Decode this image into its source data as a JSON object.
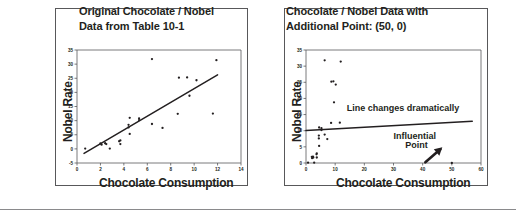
{
  "figure": {
    "background": "#ffffff",
    "ink": "#231f20",
    "frame_color": "#58585a",
    "bottom_rule": true
  },
  "panels": [
    {
      "id": "left",
      "title": "Original Chocolate / Nobel\nData from Table 10-1"
    },
    {
      "id": "right",
      "title": "Chocolate / Nobel Data with\nAdditional Point: (50, 0)"
    }
  ],
  "chart_data": [
    {
      "type": "scatter",
      "title": "Original Chocolate / Nobel Data from Table 10-1",
      "xlabel": "Chocolate Consumption",
      "ylabel": "Nobel Rate",
      "xlim": [
        0,
        14
      ],
      "ylim": [
        -5,
        35
      ],
      "xticks": [
        0,
        2,
        4,
        6,
        8,
        10,
        12,
        14
      ],
      "yticks": [
        -5,
        0,
        5,
        10,
        15,
        20,
        25,
        30,
        35
      ],
      "grid": false,
      "legend": null,
      "points": [
        {
          "x": 0.7,
          "y": 0.1
        },
        {
          "x": 2.0,
          "y": 1.9
        },
        {
          "x": 2.1,
          "y": 1.5
        },
        {
          "x": 2.4,
          "y": 2.0
        },
        {
          "x": 2.5,
          "y": 1.7
        },
        {
          "x": 2.8,
          "y": 0.1
        },
        {
          "x": 3.6,
          "y": 2.7
        },
        {
          "x": 3.7,
          "y": 1.7
        },
        {
          "x": 3.7,
          "y": 3.0
        },
        {
          "x": 4.4,
          "y": 8.5
        },
        {
          "x": 4.4,
          "y": 7.6
        },
        {
          "x": 4.5,
          "y": 11.0
        },
        {
          "x": 4.5,
          "y": 5.3
        },
        {
          "x": 5.3,
          "y": 10.2
        },
        {
          "x": 5.3,
          "y": 10.8
        },
        {
          "x": 6.4,
          "y": 31.8
        },
        {
          "x": 6.4,
          "y": 8.8
        },
        {
          "x": 7.3,
          "y": 7.4
        },
        {
          "x": 8.6,
          "y": 12.4
        },
        {
          "x": 8.7,
          "y": 25.2
        },
        {
          "x": 9.4,
          "y": 25.3
        },
        {
          "x": 9.6,
          "y": 18.8
        },
        {
          "x": 10.2,
          "y": 24.3
        },
        {
          "x": 11.6,
          "y": 12.5
        },
        {
          "x": 11.9,
          "y": 31.4
        }
      ],
      "fit_line": {
        "x1": 0.6,
        "y1": -1.6,
        "x2": 12.0,
        "y2": 26.2,
        "label": null
      },
      "annotations": []
    },
    {
      "type": "scatter",
      "title": "Chocolate / Nobel Data with Additional Point: (50, 0)",
      "xlabel": "Chocolate Consumption",
      "ylabel": "Nobel Rate",
      "xlim": [
        0,
        60
      ],
      "ylim": [
        0,
        35
      ],
      "xticks": [
        0,
        10,
        20,
        30,
        40,
        50,
        60
      ],
      "yticks": [
        0,
        5,
        10,
        15,
        20,
        25,
        30,
        35
      ],
      "grid": false,
      "legend": null,
      "points": [
        {
          "x": 0.7,
          "y": 0.1
        },
        {
          "x": 2.0,
          "y": 1.9
        },
        {
          "x": 2.1,
          "y": 1.5
        },
        {
          "x": 2.4,
          "y": 2.0
        },
        {
          "x": 2.5,
          "y": 1.7
        },
        {
          "x": 2.8,
          "y": 0.1
        },
        {
          "x": 3.6,
          "y": 2.7
        },
        {
          "x": 3.7,
          "y": 1.7
        },
        {
          "x": 3.7,
          "y": 3.0
        },
        {
          "x": 4.4,
          "y": 8.5
        },
        {
          "x": 4.4,
          "y": 7.6
        },
        {
          "x": 4.5,
          "y": 11.0
        },
        {
          "x": 4.5,
          "y": 5.3
        },
        {
          "x": 5.3,
          "y": 10.2
        },
        {
          "x": 5.3,
          "y": 10.8
        },
        {
          "x": 6.4,
          "y": 31.8
        },
        {
          "x": 6.4,
          "y": 8.8
        },
        {
          "x": 7.3,
          "y": 7.4
        },
        {
          "x": 8.6,
          "y": 12.4
        },
        {
          "x": 8.7,
          "y": 25.2
        },
        {
          "x": 9.4,
          "y": 25.3
        },
        {
          "x": 9.6,
          "y": 18.8
        },
        {
          "x": 10.2,
          "y": 24.3
        },
        {
          "x": 11.6,
          "y": 12.5
        },
        {
          "x": 11.9,
          "y": 31.4
        },
        {
          "x": 50.0,
          "y": 0.0
        }
      ],
      "fit_line": {
        "x1": 0.0,
        "y1": 10.1,
        "x2": 57.0,
        "y2": 12.9,
        "label": "Line changes dramatically"
      },
      "annotations": [
        {
          "name": "line-changes-note",
          "text": "Line changes dramatically",
          "x": 14,
          "y": 16.0
        },
        {
          "name": "influential-point-note",
          "text": "Influential",
          "x": 30,
          "y": 7.4
        },
        {
          "name": "influential-point-note-2",
          "text": "Point",
          "x": 34,
          "y": 4.6
        },
        {
          "name": "influential-point-arrow",
          "text": "arrow",
          "x": 44,
          "y": 3.0
        }
      ]
    }
  ]
}
